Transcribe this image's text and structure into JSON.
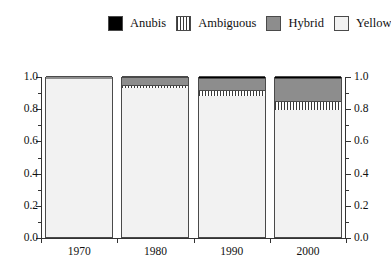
{
  "legend": {
    "items": [
      {
        "label": "Anubis",
        "key": "anubis",
        "swatch": "solid-black-swatch"
      },
      {
        "label": "Ambiguous",
        "key": "ambiguous",
        "swatch": "vertical-stripes-swatch"
      },
      {
        "label": "Hybrid",
        "key": "hybrid",
        "swatch": "solid-gray-swatch"
      },
      {
        "label": "Yellow",
        "key": "yellow",
        "swatch": "dotted-swatch"
      }
    ]
  },
  "axes": {
    "y_tick_labels": [
      "1.0",
      "0.8",
      "0.6",
      "0.4",
      "0.2",
      "0.0"
    ],
    "y_tick_values": [
      1.0,
      0.8,
      0.6,
      0.4,
      0.2,
      0.0
    ],
    "y_minor_values": [
      0.9,
      0.7,
      0.5,
      0.3,
      0.1
    ],
    "x_tick_labels": [
      "1970",
      "1980",
      "1990",
      "2000"
    ]
  },
  "chart_data": {
    "type": "bar",
    "subtype": "stacked-proportional",
    "title": "",
    "xlabel": "",
    "ylabel": "",
    "ylim": [
      0.0,
      1.0
    ],
    "grid": false,
    "legend_position": "top-center",
    "categories": [
      "1970",
      "1980",
      "1990",
      "2000"
    ],
    "series": [
      {
        "name": "Yellow",
        "values": [
          0.98,
          0.925,
          0.875,
          0.79
        ],
        "color": "#f2f2f2",
        "pattern": "dots"
      },
      {
        "name": "Ambiguous",
        "values": [
          0.0,
          0.02,
          0.04,
          0.055
        ],
        "color": "#ffffff",
        "pattern": "vertical-stripes"
      },
      {
        "name": "Hybrid",
        "values": [
          0.02,
          0.05,
          0.07,
          0.14
        ],
        "color": "#8d8d8d",
        "pattern": "solid"
      },
      {
        "name": "Anubis",
        "values": [
          0.0,
          0.005,
          0.015,
          0.015
        ],
        "color": "#000000",
        "pattern": "solid"
      }
    ]
  },
  "colors": {
    "anubis": "#000000",
    "hybrid": "#8d8d8d",
    "ambiguous": "#ffffff",
    "yellow": "#f2f2f2",
    "axis": "#333333",
    "outline": "#4a4a4a"
  }
}
